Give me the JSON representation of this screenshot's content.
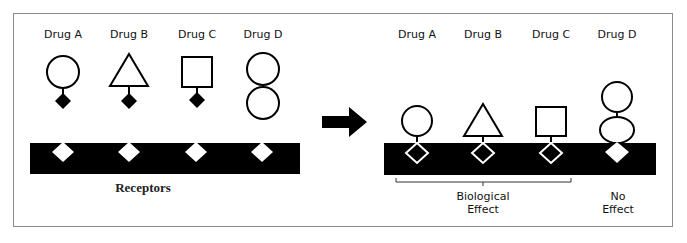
{
  "diagram": {
    "type": "drug-receptor-binding",
    "before": {
      "drugs": [
        {
          "label": "Drug A",
          "shape": "circle",
          "binding_site": "filled-diamond"
        },
        {
          "label": "Drug B",
          "shape": "triangle",
          "binding_site": "filled-diamond"
        },
        {
          "label": "Drug C",
          "shape": "square",
          "binding_site": "filled-diamond"
        },
        {
          "label": "Drug D",
          "shape": "double-circle",
          "binding_site": "none"
        }
      ],
      "receptor_label": "Receptors"
    },
    "arrow": "right-arrow",
    "after": {
      "drugs": [
        {
          "label": "Drug A",
          "shape": "circle",
          "bound": true
        },
        {
          "label": "Drug B",
          "shape": "triangle",
          "bound": true
        },
        {
          "label": "Drug C",
          "shape": "square",
          "bound": true
        },
        {
          "label": "Drug D",
          "shape": "double-circle",
          "bound": false
        }
      ],
      "outcomes": {
        "biological_effect": "Biological\nEffect",
        "biological_effect_line1": "Biological",
        "biological_effect_line2": "Effect",
        "no_effect_line1": "No",
        "no_effect_line2": "Effect"
      }
    },
    "colors": {
      "ink": "#000000",
      "background": "#ffffff",
      "frame": "#8a8a8a"
    }
  }
}
